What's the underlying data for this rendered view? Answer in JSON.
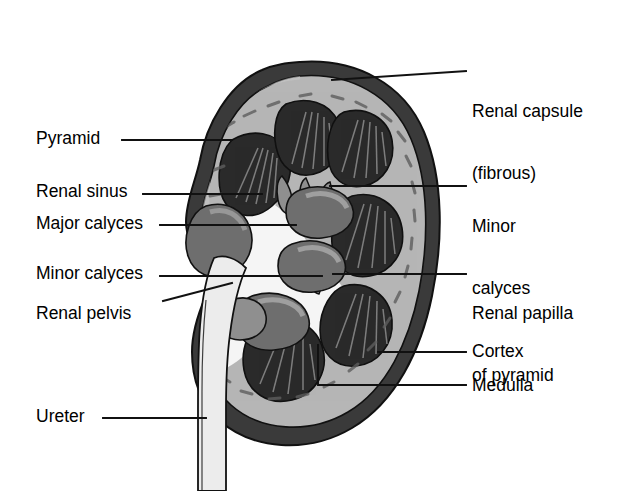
{
  "figure": {
    "type": "anatomical-diagram"
  },
  "colors": {
    "background": "#ffffff",
    "capsule_outer": "#3a3a3a",
    "capsule_shadow": "#555555",
    "cortex": "#b3b3b3",
    "cortex_light": "#c6c6c6",
    "medulla_pyramid": "#2b2b2b",
    "pyramid_striation": "#8e8e8e",
    "calyx_gray": "#6e6e6e",
    "calyx_light": "#a8a8a8",
    "sinus_white": "#f4f4f4",
    "ureter": "#e2e2e2",
    "outline": "#111111",
    "leader_line": "#111111",
    "text": "#000000"
  },
  "labels_left": [
    {
      "id": "pyramid",
      "text": "Pyramid",
      "x": 36,
      "y": 128
    },
    {
      "id": "renal-sinus",
      "text": "Renal sinus",
      "x": 36,
      "y": 181
    },
    {
      "id": "major-calyces",
      "text": "Major calyces",
      "x": 36,
      "y": 213
    },
    {
      "id": "minor-calyces",
      "text": "Minor calyces",
      "x": 36,
      "y": 263
    },
    {
      "id": "renal-pelvis",
      "text": "Renal pelvis",
      "x": 36,
      "y": 303
    },
    {
      "id": "ureter",
      "text": "Ureter",
      "x": 36,
      "y": 406
    }
  ],
  "labels_right": [
    {
      "id": "renal-capsule",
      "line1": "Renal capsule",
      "line2": "(fibrous)",
      "x": 472,
      "y": 60
    },
    {
      "id": "minor-calyces-r",
      "line1": "Minor",
      "line2": "calyces",
      "x": 472,
      "y": 175
    },
    {
      "id": "renal-papilla",
      "line1": "Renal papilla",
      "line2": "of pyramid",
      "x": 472,
      "y": 262
    },
    {
      "id": "cortex",
      "line1": "Cortex",
      "line2": "",
      "x": 472,
      "y": 341
    },
    {
      "id": "medulla",
      "line1": "Medulla",
      "line2": "",
      "x": 472,
      "y": 375
    }
  ],
  "leader_lines": [
    {
      "id": "leader-pyramid",
      "points": "122,140 232,140"
    },
    {
      "id": "leader-renal-sinus",
      "points": "143,194 262,194"
    },
    {
      "id": "leader-major-calyces",
      "points": "160,225 296,225"
    },
    {
      "id": "leader-minor-calyces",
      "points": "160,276 322,276"
    },
    {
      "id": "leader-renal-pelvis",
      "points": "163,301 232,283"
    },
    {
      "id": "leader-ureter",
      "points": "103,418 206,418"
    },
    {
      "id": "leader-renal-capsule",
      "points": "332,80 466,71"
    },
    {
      "id": "leader-minor-calyces-r",
      "points": "330,186 466,186"
    },
    {
      "id": "leader-renal-papilla",
      "points": "333,274 466,274"
    },
    {
      "id": "leader-cortex",
      "points": "378,352 466,352"
    },
    {
      "id": "leader-medulla",
      "points": "318,345 318,385 466,385"
    }
  ]
}
